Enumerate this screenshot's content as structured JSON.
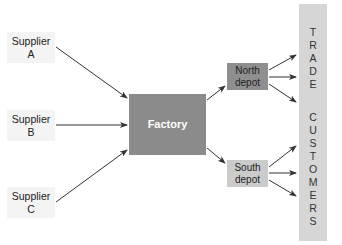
{
  "diagram": {
    "type": "supply-chain-flow",
    "suppliers": [
      {
        "line1": "Supplier",
        "line2": "A"
      },
      {
        "line1": "Supplier",
        "line2": "B"
      },
      {
        "line1": "Supplier",
        "line2": "C"
      }
    ],
    "factory": {
      "label": "Factory"
    },
    "depots": [
      {
        "line1": "North",
        "line2": "depot"
      },
      {
        "line1": "South",
        "line2": "depot"
      }
    ],
    "customers": {
      "word1": [
        "T",
        "R",
        "A",
        "D",
        "E"
      ],
      "word2": [
        "C",
        "U",
        "S",
        "T",
        "O",
        "M",
        "E",
        "R",
        "S"
      ]
    },
    "colors": {
      "factory": "#8b8b8b",
      "north_depot": "#8f8f8f",
      "south_depot": "#cbcbcb",
      "customers_bar": "#d6d6d6",
      "supplier_bg": "#f4f4f4",
      "arrow": "#333333"
    },
    "edges": [
      {
        "from": "Supplier A",
        "to": "Factory"
      },
      {
        "from": "Supplier B",
        "to": "Factory"
      },
      {
        "from": "Supplier C",
        "to": "Factory"
      },
      {
        "from": "Factory",
        "to": "North depot"
      },
      {
        "from": "Factory",
        "to": "South depot"
      },
      {
        "from": "North depot",
        "to": "Trade customers",
        "count": 3
      },
      {
        "from": "South depot",
        "to": "Trade customers",
        "count": 3
      }
    ]
  }
}
